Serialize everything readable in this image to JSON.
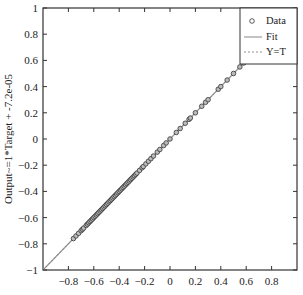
{
  "chart_data": {
    "type": "scatter",
    "title": "",
    "xlabel": "Target",
    "ylabel": "Output~=1*Target + -7.2e-05",
    "xlim": [
      -1,
      1
    ],
    "ylim": [
      -1,
      1
    ],
    "grid": false,
    "legend_position": "upper right",
    "legend": [
      "Data",
      "Fit",
      "Y=T"
    ],
    "x_ticks": [
      "-0.8",
      "-0.6",
      "-0.4",
      "-0.2",
      "0",
      "0.2",
      "0.4",
      "0.6",
      "0.8"
    ],
    "y_ticks": [
      "1",
      "0.8",
      "0.6",
      "0.4",
      "0.2",
      "0",
      "-0.2",
      "-0.4",
      "-0.6",
      "-0.8",
      "-1"
    ],
    "series": [
      {
        "name": "Data",
        "marker": "circle",
        "x": [
          -0.76,
          -0.74,
          -0.72,
          -0.7,
          -0.69,
          -0.68,
          -0.66,
          -0.65,
          -0.64,
          -0.63,
          -0.62,
          -0.61,
          -0.6,
          -0.59,
          -0.58,
          -0.57,
          -0.56,
          -0.55,
          -0.54,
          -0.53,
          -0.52,
          -0.51,
          -0.5,
          -0.49,
          -0.48,
          -0.47,
          -0.46,
          -0.45,
          -0.44,
          -0.43,
          -0.42,
          -0.41,
          -0.4,
          -0.39,
          -0.38,
          -0.37,
          -0.36,
          -0.35,
          -0.34,
          -0.33,
          -0.32,
          -0.31,
          -0.3,
          -0.29,
          -0.28,
          -0.27,
          -0.26,
          -0.24,
          -0.22,
          -0.21,
          -0.19,
          -0.17,
          -0.15,
          -0.13,
          -0.1,
          -0.08,
          -0.05,
          -0.03,
          0.0,
          0.05,
          0.08,
          0.12,
          0.15,
          0.16,
          0.2,
          0.25,
          0.28,
          0.3,
          0.38,
          0.4,
          0.45,
          0.5,
          0.55,
          0.58,
          0.6
        ],
        "y_equals_x": true
      },
      {
        "name": "Fit",
        "slope": 1,
        "intercept": -7.2e-05
      },
      {
        "name": "Y=T",
        "slope": 1,
        "intercept": 0
      }
    ]
  },
  "caption": "图 ..."
}
